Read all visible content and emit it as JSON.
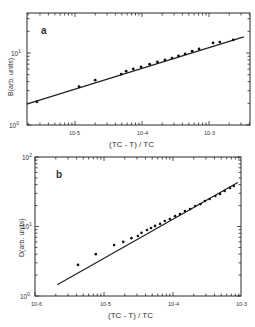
{
  "chart_data": [
    {
      "type": "scatter",
      "panel_label": "a",
      "title": "",
      "xlabel": "(Tc - T) / Tc",
      "ylabel": "B (arb. units)",
      "xscale": "log",
      "yscale": "log",
      "xlim": [
        1.9e-06,
        0.0041
      ],
      "ylim": [
        1,
        36
      ],
      "xticks": [
        {
          "value": 1e-05,
          "label": "10-5"
        },
        {
          "value": 0.0001,
          "label": "10-4"
        },
        {
          "value": 0.001,
          "label": "10-3"
        }
      ],
      "yticks": [
        {
          "value": 1,
          "label": "10 0"
        },
        {
          "value": 10,
          "label": "10 1"
        }
      ],
      "grid": false,
      "fit_line": {
        "x": [
          1.9e-06,
          0.0033
        ],
        "y": [
          1.95,
          16.8
        ]
      },
      "series": [
        {
          "name": "B",
          "x": [
            2.7e-06,
            1.15e-05,
            2e-05,
            4.9e-05,
            5.8e-05,
            7.4e-05,
            9.7e-05,
            0.00013,
            0.00017,
            0.00022,
            0.00028,
            0.00035,
            0.00044,
            0.00056,
            0.00071,
            0.00115,
            0.00145,
            0.0023
          ],
          "y": [
            2.1,
            3.4,
            4.2,
            5.1,
            5.6,
            6.0,
            6.4,
            7.0,
            7.5,
            8.0,
            8.5,
            9.1,
            9.7,
            10.6,
            11.4,
            13.8,
            14.2,
            15.2
          ]
        }
      ]
    },
    {
      "type": "scatter",
      "panel_label": "b",
      "title": "",
      "xlabel": "(Tc - T) / Tc",
      "ylabel": "D (arb. units)",
      "xscale": "log",
      "yscale": "log",
      "xlim": [
        1e-06,
        0.001
      ],
      "ylim": [
        1,
        100
      ],
      "xticks": [
        {
          "value": 1e-06,
          "label": "10-6"
        },
        {
          "value": 1e-05,
          "label": "10-5"
        },
        {
          "value": 0.0001,
          "label": "10-4"
        },
        {
          "value": 0.001,
          "label": "10-3"
        }
      ],
      "yticks": [
        {
          "value": 1,
          "label": "10 0"
        },
        {
          "value": 10,
          "label": "10 1"
        },
        {
          "value": 100,
          "label": "10 2"
        }
      ],
      "grid": false,
      "fit_line": {
        "x": [
          2.1e-06,
          0.00087
        ],
        "y": [
          1.45,
          43
        ]
      },
      "series": [
        {
          "name": "D",
          "x": [
            4.2e-06,
            7.6e-06,
            1.4e-05,
            1.9e-05,
            2.5e-05,
            3.1e-05,
            3.5e-05,
            4.2e-05,
            4.8e-05,
            5.5e-05,
            6.5e-05,
            7.6e-05,
            9e-05,
            0.000107,
            0.000126,
            0.000149,
            0.000177,
            0.00021,
            0.00025,
            0.00029,
            0.00034,
            0.00041,
            0.00048,
            0.00056,
            0.00067,
            0.00076
          ],
          "y": [
            2.8,
            4.0,
            5.4,
            6.0,
            6.8,
            7.3,
            8.1,
            8.9,
            9.5,
            10.2,
            10.9,
            12.0,
            12.8,
            14.1,
            15.1,
            16.7,
            17.8,
            19.7,
            21.0,
            23.3,
            24.9,
            27.5,
            29.4,
            32.4,
            35.8,
            38.2
          ]
        }
      ]
    }
  ],
  "labels": {
    "a_panel": "a",
    "b_panel": "b",
    "a_ylabel": "B(arb. units)",
    "b_ylabel": "D(arb. units)",
    "a_xlabel": "(TC - T) / TC",
    "b_xlabel": "(TC - T) / TC",
    "a_xtick_1": "10-5",
    "a_xtick_2": "10-4",
    "a_xtick_3": "10-3",
    "a_ytick_0": "10",
    "a_ytick_0_exp": "0",
    "a_ytick_1": "10",
    "a_ytick_1_exp": "1",
    "b_xtick_0": "10-6",
    "b_xtick_1": "10-5",
    "b_xtick_2": "10-4",
    "b_xtick_3": "10-3",
    "b_ytick_0": "10",
    "b_ytick_0_exp": "0",
    "b_ytick_1": "10",
    "b_ytick_1_exp": "1",
    "b_ytick_2": "10",
    "b_ytick_2_exp": "2"
  },
  "colors": {
    "ink": "#2a2a2a",
    "background": "#ffffff"
  }
}
